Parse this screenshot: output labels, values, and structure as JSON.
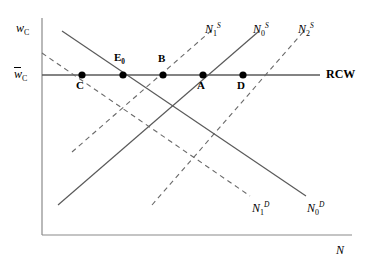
{
  "figure": {
    "type": "labor-market-supply-demand-diagram",
    "background_color": "#ffffff",
    "line_color": "#3a3a3a",
    "axis_color": "#8a8a8a"
  },
  "axes": {
    "y_axis_label_main": "w",
    "y_axis_label_sub": "C",
    "x_axis_label": "N",
    "origin": [
      42,
      235
    ],
    "y_axis_top": [
      42,
      18
    ],
    "x_axis_right": [
      352,
      235
    ]
  },
  "wage_line": {
    "tick_label_main": "w",
    "tick_label_sub": "C",
    "tick_label_has_overbar": true,
    "right_label": "RCW",
    "y_position": 75,
    "x_start": 42,
    "x_end": 320
  },
  "supply_curves": [
    {
      "name": "N1S",
      "base": "N",
      "sub": "1",
      "sup": "S",
      "style": "dashed",
      "label_x": 205,
      "label_y": 22
    },
    {
      "name": "N0S",
      "base": "N",
      "sub": "0",
      "sup": "S",
      "style": "solid",
      "label_x": 253,
      "label_y": 22
    },
    {
      "name": "N2S",
      "base": "N",
      "sub": "2",
      "sup": "S",
      "style": "dashed",
      "label_x": 298,
      "label_y": 22
    }
  ],
  "demand_curves": [
    {
      "name": "N1D",
      "base": "N",
      "sub": "1",
      "sup": "D",
      "style": "dashed",
      "label_x": 252,
      "label_y": 201
    },
    {
      "name": "N0D",
      "base": "N",
      "sub": "0",
      "sup": "D",
      "style": "solid",
      "label_x": 307,
      "label_y": 201
    }
  ],
  "points": [
    {
      "label": "C",
      "has_sub": false,
      "x": 82,
      "y": 75,
      "label_x": 76,
      "label_y": 80
    },
    {
      "label": "E",
      "has_sub": true,
      "sub": "0",
      "x": 123,
      "y": 75,
      "label_x": 114,
      "label_y": 52
    },
    {
      "label": "B",
      "has_sub": false,
      "x": 163,
      "y": 75,
      "label_x": 158,
      "label_y": 53
    },
    {
      "label": "A",
      "has_sub": false,
      "x": 203,
      "y": 75,
      "label_x": 197,
      "label_y": 80
    },
    {
      "label": "D",
      "has_sub": false,
      "x": 243,
      "y": 75,
      "label_x": 237,
      "label_y": 80
    }
  ]
}
